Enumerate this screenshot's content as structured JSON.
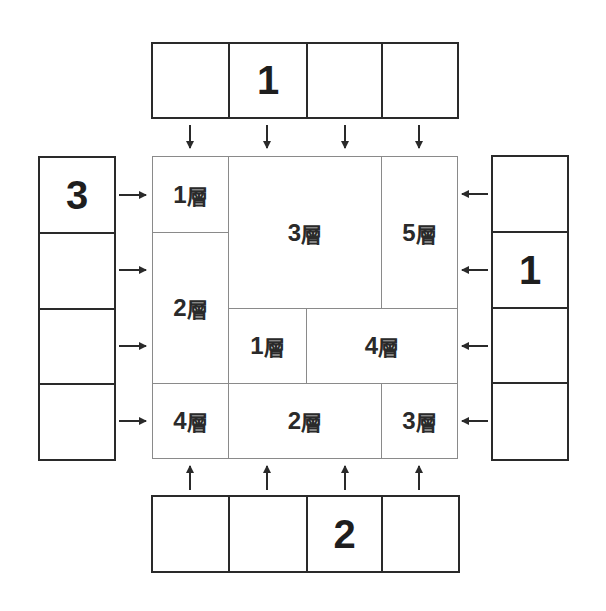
{
  "puzzle": {
    "type": "skyscraper-region",
    "unit_label": "層",
    "top_clues": [
      "",
      "1",
      "",
      ""
    ],
    "bottom_clues": [
      "",
      "",
      "2",
      ""
    ],
    "left_clues": [
      "3",
      "",
      "",
      ""
    ],
    "right_clues": [
      "",
      "1",
      "",
      ""
    ],
    "regions": [
      {
        "label_num": "1",
        "label_unit": "層",
        "col": 0,
        "row": 0,
        "colspan": 1,
        "rowspan": 1
      },
      {
        "label_num": "3",
        "label_unit": "層",
        "col": 1,
        "row": 0,
        "colspan": 2,
        "rowspan": 2
      },
      {
        "label_num": "5",
        "label_unit": "層",
        "col": 3,
        "row": 0,
        "colspan": 1,
        "rowspan": 2
      },
      {
        "label_num": "2",
        "label_unit": "層",
        "col": 0,
        "row": 1,
        "colspan": 1,
        "rowspan": 2
      },
      {
        "label_num": "1",
        "label_unit": "層",
        "col": 1,
        "row": 2,
        "colspan": 1,
        "rowspan": 1
      },
      {
        "label_num": "4",
        "label_unit": "層",
        "col": 2,
        "row": 2,
        "colspan": 2,
        "rowspan": 1
      },
      {
        "label_num": "4",
        "label_unit": "層",
        "col": 0,
        "row": 3,
        "colspan": 1,
        "rowspan": 1
      },
      {
        "label_num": "2",
        "label_unit": "層",
        "col": 1,
        "row": 3,
        "colspan": 2,
        "rowspan": 1
      },
      {
        "label_num": "3",
        "label_unit": "層",
        "col": 3,
        "row": 3,
        "colspan": 1,
        "rowspan": 1
      }
    ],
    "colors": {
      "stroke": "#2a2a2a",
      "grid_line": "#8a8a8a",
      "background": "#ffffff"
    }
  }
}
